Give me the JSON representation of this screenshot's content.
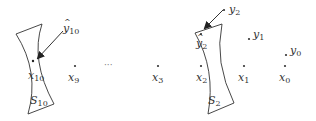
{
  "diagram": {
    "colors": {
      "ink": "#333333",
      "background": "#ffffff"
    },
    "sheets": [
      {
        "id": "S10",
        "base": "S",
        "sub": "10"
      },
      {
        "id": "S2",
        "base": "S",
        "sub": "2"
      }
    ],
    "points": [
      {
        "id": "x10",
        "base": "x",
        "sub": "10"
      },
      {
        "id": "x9",
        "base": "x",
        "sub": "9"
      },
      {
        "id": "x3",
        "base": "x",
        "sub": "3"
      },
      {
        "id": "x2",
        "base": "x",
        "sub": "2"
      },
      {
        "id": "x1",
        "base": "x",
        "sub": "1"
      },
      {
        "id": "x0",
        "base": "x",
        "sub": "0"
      }
    ],
    "y_points": [
      {
        "id": "y2",
        "base": "y",
        "sub": "2"
      },
      {
        "id": "y1",
        "base": "y",
        "sub": "1"
      },
      {
        "id": "y0",
        "base": "y",
        "sub": "0"
      }
    ],
    "yhat_points": [
      {
        "id": "yhat10",
        "base": "y",
        "sub": "10",
        "hat": "^"
      },
      {
        "id": "yhat2",
        "base": "y",
        "sub": "2",
        "hat": "^"
      }
    ],
    "ellipsis": "···"
  }
}
